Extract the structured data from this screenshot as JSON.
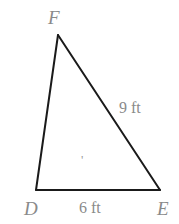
{
  "figure": {
    "type": "triangle-diagram",
    "background_color": "#ffffff",
    "stroke_color": "#1a1a1a",
    "stroke_width": 2,
    "label_color": "#8a8a8a",
    "vertices": [
      {
        "id": "F",
        "label": "F",
        "x": 58,
        "y": 35,
        "label_x": 48,
        "label_y": 8
      },
      {
        "id": "D",
        "label": "D",
        "x": 36,
        "y": 190,
        "label_x": 24,
        "label_y": 199
      },
      {
        "id": "E",
        "label": "E",
        "x": 160,
        "y": 190,
        "label_x": 157,
        "label_y": 199
      }
    ],
    "sides": [
      {
        "id": "DF",
        "from": "D",
        "to": "F",
        "label": ""
      },
      {
        "id": "FE",
        "from": "F",
        "to": "E",
        "label": "9 ft",
        "label_x": 119,
        "label_y": 100
      },
      {
        "id": "DE",
        "from": "D",
        "to": "E",
        "label": "6 ft",
        "label_x": 79,
        "label_y": 200
      }
    ],
    "annotations": [
      {
        "id": "stray-mark",
        "text": "'",
        "x": 81,
        "y": 153
      }
    ]
  }
}
